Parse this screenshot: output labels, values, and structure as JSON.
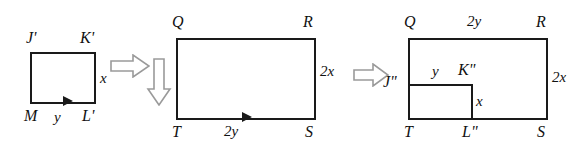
{
  "diagram": {
    "stroke_color": "#1a1a1a",
    "arrow_stroke_color": "#8a8a8a",
    "background": "#ffffff",
    "figures": [
      {
        "id": "figure-1",
        "name": "small-rectangle",
        "vertices": [
          "J'",
          "K'",
          "L'",
          "M"
        ],
        "side_labels": {
          "right": "x",
          "bottom": "y"
        },
        "has_bottom_arrowhead": true
      },
      {
        "id": "figure-2",
        "name": "enlarged-rectangle",
        "vertices": [
          "Q",
          "R",
          "S",
          "T"
        ],
        "side_labels": {
          "right": "2x",
          "bottom": "2y"
        },
        "has_bottom_arrowhead": true
      },
      {
        "id": "figure-3",
        "name": "overlay-rectangle",
        "outer_vertices": [
          "Q",
          "R",
          "S",
          "T"
        ],
        "inner_vertices": [
          "J\"",
          "K\"",
          "L\"",
          "T"
        ],
        "outer_labels": {
          "top": "2y",
          "right": "2x"
        },
        "inner_labels": {
          "top": "y",
          "right": "x"
        }
      }
    ],
    "arrows": [
      {
        "id": "arrow-right-1",
        "direction": "right"
      },
      {
        "id": "arrow-down-1",
        "direction": "down"
      },
      {
        "id": "arrow-right-2",
        "direction": "right"
      }
    ],
    "labels": {
      "f1_J": "J'",
      "f1_K": "K'",
      "f1_M": "M",
      "f1_L": "L'",
      "f1_x": "x",
      "f1_y": "y",
      "f2_Q": "Q",
      "f2_R": "R",
      "f2_T": "T",
      "f2_S": "S",
      "f2_2x": "2x",
      "f2_2y": "2y",
      "f3_Q": "Q",
      "f3_R": "R",
      "f3_T": "T",
      "f3_S": "S",
      "f3_2y": "2y",
      "f3_2x": "2x",
      "f3_J": "J\"",
      "f3_K": "K\"",
      "f3_L": "L\"",
      "f3_y": "y",
      "f3_x": "x"
    }
  }
}
